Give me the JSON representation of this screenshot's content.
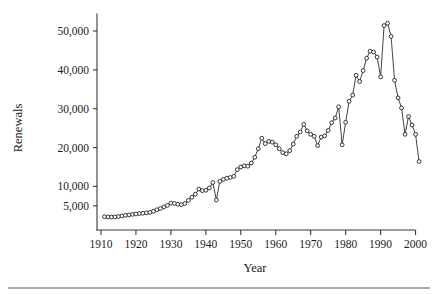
{
  "figure": {
    "background_color": "#ffffff",
    "line_color": "#2b2b2b",
    "marker_fill": "#ffffff",
    "marker_stroke": "#202020",
    "axis_color": "#3a3a3a",
    "footer_rule_color": "#5a5a5a"
  },
  "chart_data": {
    "type": "line",
    "title": "",
    "subtitle": "",
    "xlabel": "Year",
    "ylabel": "Renewals",
    "xlim": [
      1909,
      2002
    ],
    "ylim": [
      0,
      54000
    ],
    "grid": false,
    "legend": null,
    "legend_position": "none",
    "markers": "open-circle",
    "xticks": [
      1910,
      1920,
      1930,
      1940,
      1950,
      1960,
      1970,
      1980,
      1990,
      2000
    ],
    "xtick_labels": [
      "1910",
      "1920",
      "1930",
      "1940",
      "1950",
      "1960",
      "1970",
      "1980",
      "1990",
      "2000"
    ],
    "yticks": [
      5000,
      10000,
      20000,
      30000,
      40000,
      50000
    ],
    "ytick_labels": [
      "5,000",
      "10,000",
      "20,000",
      "30,000",
      "40,000",
      "50,000"
    ],
    "x": [
      1911,
      1912,
      1913,
      1914,
      1915,
      1916,
      1917,
      1918,
      1919,
      1920,
      1921,
      1922,
      1923,
      1924,
      1925,
      1926,
      1927,
      1928,
      1929,
      1930,
      1931,
      1932,
      1933,
      1934,
      1935,
      1936,
      1937,
      1938,
      1939,
      1940,
      1941,
      1942,
      1943,
      1944,
      1945,
      1946,
      1947,
      1948,
      1949,
      1950,
      1951,
      1952,
      1953,
      1954,
      1955,
      1956,
      1957,
      1958,
      1959,
      1960,
      1961,
      1962,
      1963,
      1964,
      1965,
      1966,
      1967,
      1968,
      1969,
      1970,
      1971,
      1972,
      1973,
      1974,
      1975,
      1976,
      1977,
      1978,
      1979,
      1980,
      1981,
      1982,
      1983,
      1984,
      1985,
      1986,
      1987,
      1988,
      1989,
      1990,
      1991,
      1992,
      1993,
      1994,
      1995,
      1996,
      1997,
      1998,
      1999,
      2000,
      2001
    ],
    "values": [
      2200,
      2150,
      2100,
      2150,
      2250,
      2400,
      2550,
      2650,
      2800,
      2900,
      3000,
      3100,
      3200,
      3300,
      3600,
      4000,
      4300,
      4700,
      5100,
      5700,
      5600,
      5400,
      5300,
      5600,
      6400,
      7200,
      8000,
      9300,
      8900,
      9000,
      9600,
      11000,
      6500,
      11300,
      11800,
      12100,
      12300,
      12600,
      14300,
      15000,
      15300,
      15200,
      16000,
      17500,
      19700,
      22400,
      21000,
      21600,
      21400,
      20700,
      19700,
      18700,
      18400,
      19200,
      20900,
      22900,
      24000,
      26000,
      24300,
      23400,
      22900,
      20500,
      22700,
      23000,
      24400,
      26400,
      27600,
      30500,
      20700,
      26500,
      31900,
      33500,
      38600,
      37000,
      39800,
      43000,
      44800,
      44600,
      43300,
      38200,
      51400,
      52000,
      48600,
      37300,
      32800,
      30200,
      23400,
      28000,
      25800,
      23400,
      16400
    ],
    "series": [
      {
        "name": "Renewals",
        "values": [
          2200,
          2150,
          2100,
          2150,
          2250,
          2400,
          2550,
          2650,
          2800,
          2900,
          3000,
          3100,
          3200,
          3300,
          3600,
          4000,
          4300,
          4700,
          5100,
          5700,
          5600,
          5400,
          5300,
          5600,
          6400,
          7200,
          8000,
          9300,
          8900,
          9000,
          9600,
          11000,
          6500,
          11300,
          11800,
          12100,
          12300,
          12600,
          14300,
          15000,
          15300,
          15200,
          16000,
          17500,
          19700,
          22400,
          21000,
          21600,
          21400,
          20700,
          19700,
          18700,
          18400,
          19200,
          20900,
          22900,
          24000,
          26000,
          24300,
          23400,
          22900,
          20500,
          22700,
          23000,
          24400,
          26400,
          27600,
          30500,
          20700,
          26500,
          31900,
          33500,
          38600,
          37000,
          39800,
          43000,
          44800,
          44600,
          43300,
          38200,
          51400,
          52000,
          48600,
          37300,
          32800,
          30200,
          23400,
          28000,
          25800,
          23400,
          16400
        ]
      }
    ],
    "annotations": []
  }
}
